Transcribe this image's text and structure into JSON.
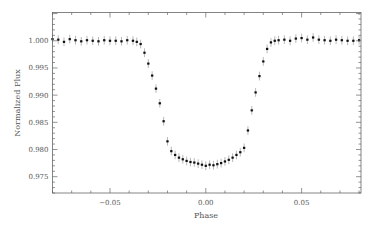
{
  "chart_data": {
    "type": "scatter",
    "title": "",
    "xlabel": "Phase",
    "ylabel": "Normalized Flux",
    "xlim": [
      -0.08,
      0.081
    ],
    "ylim": [
      0.972,
      1.0052
    ],
    "grid": false,
    "legend": null,
    "x_ticks": [
      -0.05,
      0.0,
      0.05
    ],
    "x_tick_labels": [
      "−0.05",
      "0.00",
      "0.05"
    ],
    "y_ticks": [
      1.0,
      0.995,
      0.99,
      0.985,
      0.98,
      0.975
    ],
    "y_tick_labels": [
      "1.000",
      "0.995",
      "0.990",
      "0.985",
      "0.980",
      "0.975"
    ],
    "series": [
      {
        "name": "Transit light curve",
        "marker_color": "#111111",
        "errorbar_color": "#9a9a9a",
        "errorbar_halfwidth": 0.0008,
        "x": [
          -0.08,
          -0.077,
          -0.074,
          -0.071,
          -0.068,
          -0.065,
          -0.062,
          -0.059,
          -0.056,
          -0.053,
          -0.05,
          -0.047,
          -0.044,
          -0.041,
          -0.038,
          -0.036,
          -0.034,
          -0.032,
          -0.03,
          -0.028,
          -0.026,
          -0.024,
          -0.022,
          -0.02,
          -0.018,
          -0.016,
          -0.014,
          -0.012,
          -0.01,
          -0.008,
          -0.006,
          -0.004,
          -0.002,
          0.0,
          0.002,
          0.004,
          0.006,
          0.008,
          0.01,
          0.012,
          0.014,
          0.016,
          0.018,
          0.02,
          0.022,
          0.024,
          0.026,
          0.028,
          0.03,
          0.032,
          0.034,
          0.036,
          0.038,
          0.041,
          0.044,
          0.047,
          0.05,
          0.053,
          0.056,
          0.059,
          0.062,
          0.065,
          0.068,
          0.071,
          0.074,
          0.077,
          0.08
        ],
        "y": [
          1.0003,
          1.0002,
          0.9998,
          1.0003,
          1.0001,
          0.9999,
          1.0001,
          1.0,
          0.9999,
          1.0001,
          1.0,
          1.0,
          0.9999,
          1.0001,
          1.0,
          0.9998,
          0.9994,
          0.9978,
          0.9958,
          0.9936,
          0.9912,
          0.9885,
          0.9852,
          0.9815,
          0.9797,
          0.979,
          0.9785,
          0.9782,
          0.9779,
          0.9777,
          0.9776,
          0.9774,
          0.9772,
          0.977,
          0.9772,
          0.9771,
          0.9773,
          0.9775,
          0.9778,
          0.9781,
          0.9785,
          0.979,
          0.9795,
          0.9803,
          0.9835,
          0.9872,
          0.9905,
          0.9935,
          0.9962,
          0.9985,
          0.9997,
          1.0,
          1.0001,
          1.0002,
          1.0,
          1.0004,
          1.0005,
          1.0002,
          1.0006,
          1.0002,
          1.0001,
          1.0,
          1.0002,
          1.0001,
          1.0,
          1.0,
          1.0001
        ]
      }
    ]
  }
}
